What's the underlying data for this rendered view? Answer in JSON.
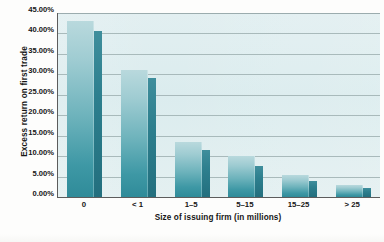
{
  "chart_data": {
    "type": "bar",
    "title": "",
    "xlabel": "Size of issuing firm (in millions)",
    "ylabel": "Excess return on first trade",
    "categories": [
      "0",
      "< 1",
      "1–5",
      "5–15",
      "15–25",
      "> 25"
    ],
    "series": [
      {
        "name": "front-face",
        "values": [
          43.0,
          31.0,
          13.5,
          10.0,
          5.5,
          3.0
        ]
      },
      {
        "name": "side-face",
        "values": [
          40.5,
          29.0,
          11.5,
          7.5,
          4.0,
          2.2
        ]
      }
    ],
    "ylim": [
      0,
      45
    ],
    "ytick_values": [
      0,
      5,
      10,
      15,
      20,
      25,
      30,
      35,
      40,
      45
    ],
    "ytick_labels": [
      "0.00%",
      "5.00%",
      "10.00%",
      "15.00%",
      "20.00%",
      "25.00%",
      "30.00%",
      "35.00%",
      "40.00%",
      "45.00%"
    ],
    "grid": true,
    "legend": "none",
    "colors": {
      "bar_front_light": "#b9d9dd",
      "bar_front_dark": "#2f8b99",
      "bar_side": "#2d7f8e",
      "plot_background": "#dfeef0",
      "gridline": "#9fb0b2",
      "axis_line": "#5c5c5c",
      "text": "#161616"
    }
  }
}
